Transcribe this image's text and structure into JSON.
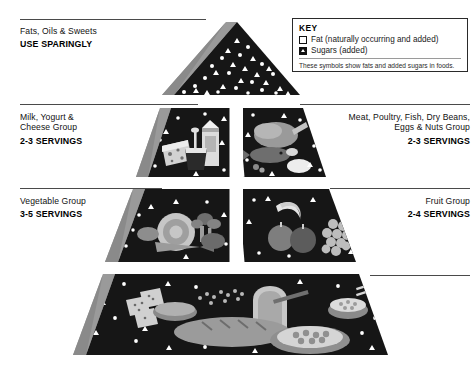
{
  "diagram": {
    "colors": {
      "tier_fill": "#161616",
      "side_face": "#8d8d8d",
      "rule": "#4a4a4a",
      "background": "#ffffff",
      "food_light": "#c9c9c9",
      "food_mid": "#8f8f8f",
      "food_dark": "#5a5a5a",
      "symbol": "#ffffff"
    }
  },
  "key": {
    "title": "KEY",
    "items": [
      {
        "symbol": "square-outline-icon",
        "label": "Fat (naturally occurring and added)"
      },
      {
        "symbol": "triangle-filled-icon",
        "label": "Sugars (added)"
      }
    ],
    "note": "These symbols show fats and added sugars in foods."
  },
  "tiers": [
    {
      "id": "fats-oils-sweets",
      "name": "Fats, Oils & Sweets",
      "servings": "USE SPARINGLY",
      "side": "left",
      "align": "left"
    },
    {
      "id": "milk-yogurt-cheese",
      "name_lines": [
        "Milk, Yogurt &",
        "Cheese Group"
      ],
      "servings": "2-3 SERVINGS",
      "side": "left",
      "align": "left"
    },
    {
      "id": "meat-poultry-fish",
      "name_lines": [
        "Meat, Poultry, Fish, Dry Beans,",
        "Eggs & Nuts Group"
      ],
      "servings": "2-3 SERVINGS",
      "side": "right",
      "align": "right"
    },
    {
      "id": "vegetable",
      "name_lines": [
        "Vegetable Group"
      ],
      "servings": "3-5 SERVINGS",
      "side": "left",
      "align": "left"
    },
    {
      "id": "fruit",
      "name_lines": [
        "Fruit Group"
      ],
      "servings": "2-4 SERVINGS",
      "side": "right",
      "align": "right"
    },
    {
      "id": "bread-cereal-rice-pasta",
      "name_lines": [
        "Bread, Cereal,",
        "Rice & Pasta",
        "Group"
      ],
      "servings_lines": [
        "6-11",
        "SERVINGS"
      ],
      "side": "inside",
      "align": "right"
    }
  ],
  "labels": {
    "fats_name": "Fats, Oils & Sweets",
    "fats_servings": "USE SPARINGLY",
    "milk_l1": "Milk, Yogurt &",
    "milk_l2": "Cheese Group",
    "milk_servings": "2-3 SERVINGS",
    "meat_l1": "Meat, Poultry, Fish, Dry Beans,",
    "meat_l2": "Eggs & Nuts Group",
    "meat_servings": "2-3 SERVINGS",
    "veg_l1": "Vegetable Group",
    "veg_servings": "3-5 SERVINGS",
    "fruit_l1": "Fruit Group",
    "fruit_servings": "2-4 SERVINGS",
    "bread_l1": "Bread, Cereal,",
    "bread_l2": "Rice & Pasta",
    "bread_l3": "Group",
    "bread_servings_1": "6-11",
    "bread_servings_2": "SERVINGS"
  }
}
